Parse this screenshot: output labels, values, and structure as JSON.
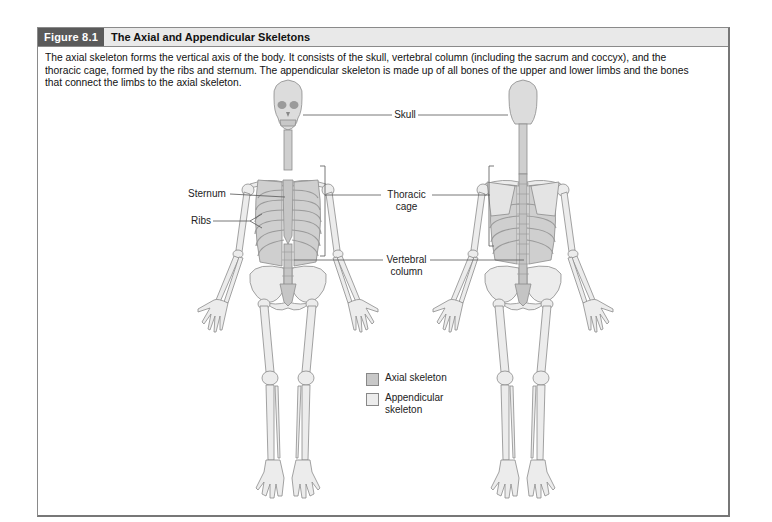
{
  "figure": {
    "number": "Figure 8.1",
    "title": "The Axial and Appendicular Skeletons",
    "caption": "The axial skeleton forms the vertical axis of the body. It consists of the skull, vertebral column (including the sacrum and coccyx), and the thoracic cage, formed by the ribs and sternum. The appendicular skeleton is made up of all bones of the upper and lower limbs and the bones that connect the limbs to the axial skeleton."
  },
  "labels": {
    "skull": "Skull",
    "sternum": "Sternum",
    "ribs": "Ribs",
    "thoracic_cage_1": "Thoracic",
    "thoracic_cage_2": "cage",
    "vertebral_column_1": "Vertebral",
    "vertebral_column_2": "column"
  },
  "views": [
    "anterior",
    "posterior"
  ],
  "legend": {
    "items": [
      {
        "label_1": "Axial skeleton",
        "label_2": "",
        "color": "#c8c8c8"
      },
      {
        "label_1": "Appendicular",
        "label_2": "skeleton",
        "color": "#ececec"
      }
    ]
  },
  "colors": {
    "header_badge": "#5a5a5a",
    "header_bg": "#e9e9e9",
    "frame_border": "#8a8a8a",
    "axial_bone": "#c8c8c8",
    "appendicular_bone": "#ececec",
    "bone_outline": "#8c8c8c"
  }
}
